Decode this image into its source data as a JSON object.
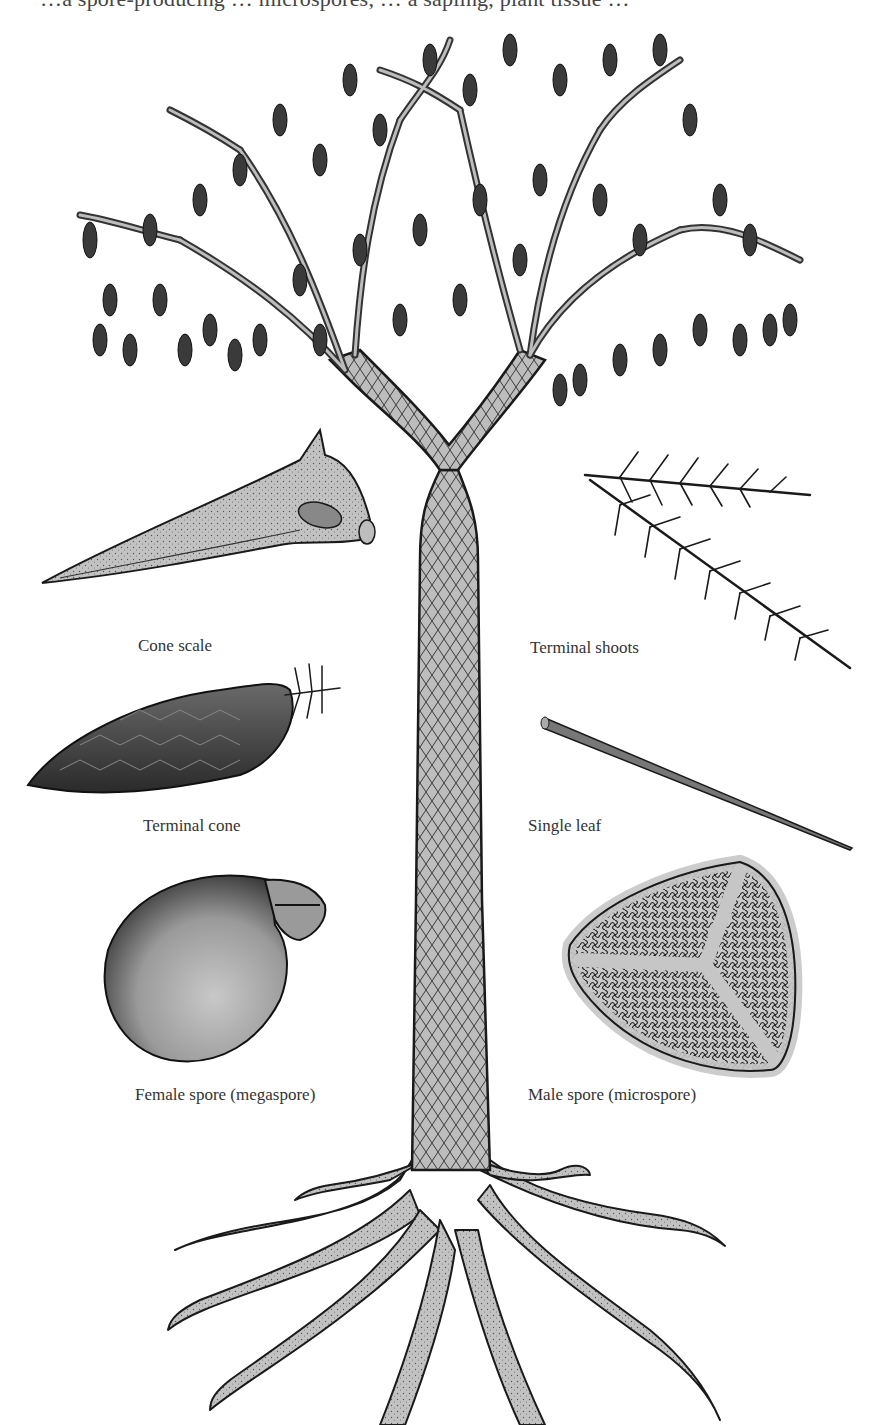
{
  "figure": {
    "top_caption_partial": "…a spore-producing … microspores, … a sapling, plant tissue …",
    "colors": {
      "ink": "#1a1a1a",
      "fill": "#bdbdbd",
      "dark_fill": "#555555",
      "background": "#ffffff"
    }
  },
  "labels": {
    "cone_scale": "Cone scale",
    "terminal_shoots": "Terminal shoots",
    "terminal_cone": "Terminal cone",
    "single_leaf": "Single leaf",
    "female_spore": "Female spore (megaspore)",
    "male_spore": "Male spore (microspore)"
  },
  "parts": [
    {
      "id": "crown",
      "name": "Crown with pendant cones"
    },
    {
      "id": "trunk",
      "name": "Trunk with diamond leaf-scar pattern"
    },
    {
      "id": "roots",
      "name": "Stigmaria root system"
    },
    {
      "id": "cone-scale",
      "name": "Cone scale"
    },
    {
      "id": "terminal-shoots",
      "name": "Terminal shoots"
    },
    {
      "id": "terminal-cone",
      "name": "Terminal cone"
    },
    {
      "id": "single-leaf",
      "name": "Single leaf"
    },
    {
      "id": "megaspore",
      "name": "Female spore (megaspore)"
    },
    {
      "id": "microspore",
      "name": "Male spore (microspore)"
    }
  ]
}
